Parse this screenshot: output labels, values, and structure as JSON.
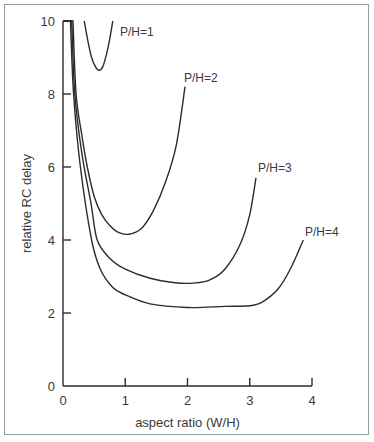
{
  "chart_data": {
    "type": "line",
    "title": "",
    "xlabel": "aspect ratio (W/H)",
    "ylabel": "relative RC delay",
    "xlim": [
      0,
      4
    ],
    "ylim": [
      0,
      10
    ],
    "xticks": [
      0,
      1,
      2,
      3,
      4
    ],
    "yticks": [
      0,
      2,
      4,
      6,
      8,
      10
    ],
    "xtick_labels": [
      "0",
      "1",
      "2",
      "3",
      "4"
    ],
    "ytick_labels": [
      "0",
      "2",
      "4",
      "6",
      "8",
      "10"
    ],
    "grid": false,
    "legend": "none",
    "series": [
      {
        "name": "P/H=1",
        "label": "P/H=1",
        "points": [
          [
            0.34,
            10.0
          ],
          [
            0.4,
            9.45
          ],
          [
            0.46,
            9.0
          ],
          [
            0.52,
            8.75
          ],
          [
            0.58,
            8.65
          ],
          [
            0.64,
            8.75
          ],
          [
            0.7,
            9.1
          ],
          [
            0.75,
            9.5
          ],
          [
            0.8,
            10.0
          ]
        ]
      },
      {
        "name": "P/H=2",
        "label": "P/H=2",
        "points": [
          [
            0.0,
            10.0
          ],
          [
            0.16,
            10.0
          ],
          [
            0.21,
            8.0
          ],
          [
            0.3,
            6.9
          ],
          [
            0.39,
            6.0
          ],
          [
            0.5,
            5.2
          ],
          [
            0.62,
            4.7
          ],
          [
            0.75,
            4.4
          ],
          [
            0.9,
            4.2
          ],
          [
            1.06,
            4.16
          ],
          [
            1.25,
            4.3
          ],
          [
            1.45,
            4.8
          ],
          [
            1.65,
            5.6
          ],
          [
            1.82,
            6.6
          ],
          [
            1.96,
            8.2
          ]
        ]
      },
      {
        "name": "P/H=3",
        "label": "P/H=3",
        "points": [
          [
            0.0,
            10.0
          ],
          [
            0.14,
            10.0
          ],
          [
            0.19,
            8.0
          ],
          [
            0.3,
            6.4
          ],
          [
            0.45,
            5.0
          ],
          [
            0.55,
            4.0
          ],
          [
            0.75,
            3.5
          ],
          [
            1.0,
            3.2
          ],
          [
            1.4,
            2.95
          ],
          [
            1.8,
            2.83
          ],
          [
            2.09,
            2.82
          ],
          [
            2.35,
            2.9
          ],
          [
            2.6,
            3.2
          ],
          [
            2.85,
            3.9
          ],
          [
            3.0,
            4.7
          ],
          [
            3.1,
            5.7
          ]
        ]
      },
      {
        "name": "P/H=4",
        "label": "P/H=4",
        "points": [
          [
            0.0,
            10.0
          ],
          [
            0.12,
            10.0
          ],
          [
            0.17,
            8.0
          ],
          [
            0.28,
            6.0
          ],
          [
            0.46,
            4.0
          ],
          [
            0.6,
            3.2
          ],
          [
            0.8,
            2.7
          ],
          [
            1.0,
            2.5
          ],
          [
            1.4,
            2.25
          ],
          [
            2.0,
            2.15
          ],
          [
            2.6,
            2.18
          ],
          [
            3.0,
            2.2
          ],
          [
            3.2,
            2.3
          ],
          [
            3.45,
            2.65
          ],
          [
            3.65,
            3.2
          ],
          [
            3.86,
            4.0
          ]
        ]
      }
    ]
  },
  "labels": {
    "ph1": "P/H=1",
    "ph2": "P/H=2",
    "ph3": "P/H=3",
    "ph4": "P/H=4"
  }
}
